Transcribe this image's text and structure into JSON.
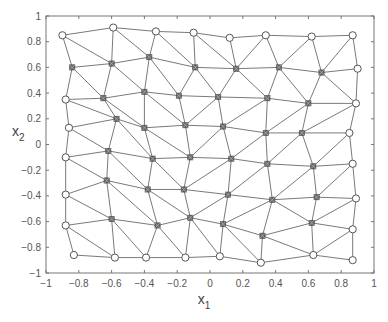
{
  "chart_data": {
    "type": "scatter",
    "subtype": "triangular-mesh",
    "title": "",
    "xlabel": "x",
    "xlabel_sub": "1",
    "ylabel": "x",
    "ylabel_sub": "2",
    "xlim": [
      -1,
      1
    ],
    "ylim": [
      -1,
      1
    ],
    "grid": false,
    "legend": null,
    "xticks": [
      -1,
      -0.8,
      -0.6,
      -0.4,
      -0.2,
      0,
      0.2,
      0.4,
      0.6,
      0.8,
      1
    ],
    "xtick_labels": [
      "−1",
      "−0.8",
      "−0.6",
      "−0.4",
      "−0.2",
      "0",
      "0.2",
      "0.4",
      "0.6",
      "0.8",
      "1"
    ],
    "yticks": [
      -1,
      -0.8,
      -0.6,
      -0.4,
      -0.2,
      0,
      0.2,
      0.4,
      0.6,
      0.8,
      1
    ],
    "ytick_labels": [
      "−1",
      "−0.8",
      "−0.6",
      "−0.4",
      "−0.2",
      "0",
      "0.2",
      "0.4",
      "0.6",
      "0.8",
      "1"
    ],
    "line_color": "#7a7a7a",
    "marker_color": "#555555",
    "nodes": [
      {
        "id": 0,
        "x": -0.9,
        "y": 0.85,
        "boundary": true
      },
      {
        "id": 1,
        "x": -0.59,
        "y": 0.91,
        "boundary": true
      },
      {
        "id": 2,
        "x": -0.33,
        "y": 0.88,
        "boundary": true
      },
      {
        "id": 3,
        "x": -0.1,
        "y": 0.87,
        "boundary": true
      },
      {
        "id": 4,
        "x": 0.12,
        "y": 0.83,
        "boundary": true
      },
      {
        "id": 5,
        "x": 0.34,
        "y": 0.85,
        "boundary": true
      },
      {
        "id": 6,
        "x": 0.62,
        "y": 0.84,
        "boundary": true
      },
      {
        "id": 7,
        "x": 0.87,
        "y": 0.85,
        "boundary": true
      },
      {
        "id": 8,
        "x": -0.84,
        "y": 0.6,
        "boundary": false
      },
      {
        "id": 9,
        "x": -0.6,
        "y": 0.63,
        "boundary": false
      },
      {
        "id": 10,
        "x": -0.37,
        "y": 0.68,
        "boundary": false
      },
      {
        "id": 11,
        "x": -0.09,
        "y": 0.6,
        "boundary": false
      },
      {
        "id": 12,
        "x": 0.16,
        "y": 0.59,
        "boundary": false
      },
      {
        "id": 13,
        "x": 0.42,
        "y": 0.6,
        "boundary": false
      },
      {
        "id": 14,
        "x": 0.68,
        "y": 0.56,
        "boundary": false
      },
      {
        "id": 15,
        "x": 0.9,
        "y": 0.59,
        "boundary": true
      },
      {
        "id": 16,
        "x": -0.88,
        "y": 0.35,
        "boundary": true
      },
      {
        "id": 17,
        "x": -0.65,
        "y": 0.36,
        "boundary": false
      },
      {
        "id": 18,
        "x": -0.4,
        "y": 0.41,
        "boundary": false
      },
      {
        "id": 19,
        "x": -0.19,
        "y": 0.38,
        "boundary": false
      },
      {
        "id": 20,
        "x": 0.05,
        "y": 0.37,
        "boundary": false
      },
      {
        "id": 21,
        "x": 0.35,
        "y": 0.36,
        "boundary": false
      },
      {
        "id": 22,
        "x": 0.6,
        "y": 0.32,
        "boundary": false
      },
      {
        "id": 23,
        "x": 0.89,
        "y": 0.32,
        "boundary": true
      },
      {
        "id": 24,
        "x": -0.86,
        "y": 0.13,
        "boundary": true
      },
      {
        "id": 25,
        "x": -0.57,
        "y": 0.2,
        "boundary": false
      },
      {
        "id": 26,
        "x": -0.4,
        "y": 0.13,
        "boundary": false
      },
      {
        "id": 27,
        "x": -0.15,
        "y": 0.15,
        "boundary": false
      },
      {
        "id": 28,
        "x": 0.08,
        "y": 0.14,
        "boundary": false
      },
      {
        "id": 29,
        "x": 0.34,
        "y": 0.09,
        "boundary": false
      },
      {
        "id": 30,
        "x": 0.56,
        "y": 0.09,
        "boundary": false
      },
      {
        "id": 31,
        "x": 0.85,
        "y": 0.09,
        "boundary": true
      },
      {
        "id": 32,
        "x": -0.88,
        "y": -0.1,
        "boundary": true
      },
      {
        "id": 33,
        "x": -0.62,
        "y": -0.05,
        "boundary": false
      },
      {
        "id": 34,
        "x": -0.35,
        "y": -0.11,
        "boundary": false
      },
      {
        "id": 35,
        "x": -0.12,
        "y": -0.1,
        "boundary": false
      },
      {
        "id": 36,
        "x": 0.13,
        "y": -0.11,
        "boundary": false
      },
      {
        "id": 37,
        "x": 0.35,
        "y": -0.15,
        "boundary": false
      },
      {
        "id": 38,
        "x": 0.63,
        "y": -0.17,
        "boundary": false
      },
      {
        "id": 39,
        "x": 0.87,
        "y": -0.15,
        "boundary": true
      },
      {
        "id": 40,
        "x": -0.88,
        "y": -0.39,
        "boundary": true
      },
      {
        "id": 41,
        "x": -0.63,
        "y": -0.28,
        "boundary": false
      },
      {
        "id": 42,
        "x": -0.38,
        "y": -0.35,
        "boundary": false
      },
      {
        "id": 43,
        "x": -0.16,
        "y": -0.35,
        "boundary": false
      },
      {
        "id": 44,
        "x": 0.11,
        "y": -0.39,
        "boundary": false
      },
      {
        "id": 45,
        "x": 0.38,
        "y": -0.43,
        "boundary": false
      },
      {
        "id": 46,
        "x": 0.65,
        "y": -0.41,
        "boundary": false
      },
      {
        "id": 47,
        "x": 0.89,
        "y": -0.42,
        "boundary": true
      },
      {
        "id": 48,
        "x": -0.88,
        "y": -0.63,
        "boundary": true
      },
      {
        "id": 49,
        "x": -0.6,
        "y": -0.58,
        "boundary": false
      },
      {
        "id": 50,
        "x": -0.32,
        "y": -0.63,
        "boundary": false
      },
      {
        "id": 51,
        "x": -0.12,
        "y": -0.57,
        "boundary": false
      },
      {
        "id": 52,
        "x": 0.08,
        "y": -0.62,
        "boundary": false
      },
      {
        "id": 53,
        "x": 0.32,
        "y": -0.71,
        "boundary": false
      },
      {
        "id": 54,
        "x": 0.62,
        "y": -0.61,
        "boundary": false
      },
      {
        "id": 55,
        "x": 0.87,
        "y": -0.66,
        "boundary": true
      },
      {
        "id": 56,
        "x": -0.83,
        "y": -0.86,
        "boundary": true
      },
      {
        "id": 57,
        "x": -0.58,
        "y": -0.88,
        "boundary": true
      },
      {
        "id": 58,
        "x": -0.39,
        "y": -0.88,
        "boundary": true
      },
      {
        "id": 59,
        "x": -0.15,
        "y": -0.88,
        "boundary": true
      },
      {
        "id": 60,
        "x": 0.06,
        "y": -0.87,
        "boundary": true
      },
      {
        "id": 61,
        "x": 0.31,
        "y": -0.92,
        "boundary": true
      },
      {
        "id": 62,
        "x": 0.63,
        "y": -0.86,
        "boundary": true
      },
      {
        "id": 63,
        "x": 0.87,
        "y": -0.9,
        "boundary": true
      }
    ],
    "edges": [
      [
        0,
        1
      ],
      [
        1,
        2
      ],
      [
        2,
        3
      ],
      [
        3,
        4
      ],
      [
        4,
        5
      ],
      [
        5,
        6
      ],
      [
        6,
        7
      ],
      [
        0,
        8
      ],
      [
        0,
        9
      ],
      [
        1,
        9
      ],
      [
        1,
        10
      ],
      [
        2,
        10
      ],
      [
        2,
        11
      ],
      [
        3,
        11
      ],
      [
        3,
        12
      ],
      [
        4,
        12
      ],
      [
        5,
        12
      ],
      [
        5,
        13
      ],
      [
        6,
        13
      ],
      [
        6,
        14
      ],
      [
        7,
        14
      ],
      [
        7,
        15
      ],
      [
        8,
        9
      ],
      [
        9,
        10
      ],
      [
        10,
        11
      ],
      [
        11,
        12
      ],
      [
        12,
        13
      ],
      [
        13,
        14
      ],
      [
        14,
        15
      ],
      [
        8,
        16
      ],
      [
        8,
        17
      ],
      [
        9,
        17
      ],
      [
        9,
        18
      ],
      [
        10,
        18
      ],
      [
        10,
        19
      ],
      [
        11,
        19
      ],
      [
        11,
        20
      ],
      [
        12,
        20
      ],
      [
        12,
        21
      ],
      [
        13,
        21
      ],
      [
        13,
        22
      ],
      [
        14,
        22
      ],
      [
        14,
        23
      ],
      [
        15,
        23
      ],
      [
        16,
        17
      ],
      [
        17,
        18
      ],
      [
        18,
        19
      ],
      [
        19,
        20
      ],
      [
        20,
        21
      ],
      [
        21,
        22
      ],
      [
        22,
        23
      ],
      [
        16,
        24
      ],
      [
        16,
        25
      ],
      [
        17,
        25
      ],
      [
        17,
        26
      ],
      [
        18,
        26
      ],
      [
        18,
        27
      ],
      [
        19,
        27
      ],
      [
        20,
        27
      ],
      [
        20,
        28
      ],
      [
        21,
        28
      ],
      [
        21,
        29
      ],
      [
        22,
        29
      ],
      [
        22,
        30
      ],
      [
        23,
        30
      ],
      [
        23,
        31
      ],
      [
        24,
        25
      ],
      [
        25,
        26
      ],
      [
        26,
        27
      ],
      [
        27,
        28
      ],
      [
        28,
        29
      ],
      [
        29,
        30
      ],
      [
        30,
        31
      ],
      [
        24,
        32
      ],
      [
        24,
        33
      ],
      [
        25,
        33
      ],
      [
        25,
        34
      ],
      [
        26,
        34
      ],
      [
        26,
        35
      ],
      [
        27,
        35
      ],
      [
        28,
        35
      ],
      [
        28,
        36
      ],
      [
        29,
        36
      ],
      [
        29,
        37
      ],
      [
        30,
        37
      ],
      [
        30,
        38
      ],
      [
        31,
        38
      ],
      [
        31,
        39
      ],
      [
        32,
        33
      ],
      [
        33,
        34
      ],
      [
        34,
        35
      ],
      [
        35,
        36
      ],
      [
        36,
        37
      ],
      [
        37,
        38
      ],
      [
        38,
        39
      ],
      [
        32,
        40
      ],
      [
        32,
        41
      ],
      [
        33,
        41
      ],
      [
        33,
        42
      ],
      [
        34,
        42
      ],
      [
        34,
        43
      ],
      [
        35,
        43
      ],
      [
        36,
        43
      ],
      [
        36,
        44
      ],
      [
        37,
        44
      ],
      [
        37,
        45
      ],
      [
        38,
        45
      ],
      [
        38,
        46
      ],
      [
        39,
        46
      ],
      [
        39,
        47
      ],
      [
        40,
        41
      ],
      [
        41,
        42
      ],
      [
        42,
        43
      ],
      [
        43,
        44
      ],
      [
        44,
        45
      ],
      [
        45,
        46
      ],
      [
        46,
        47
      ],
      [
        40,
        48
      ],
      [
        40,
        49
      ],
      [
        41,
        49
      ],
      [
        41,
        50
      ],
      [
        42,
        50
      ],
      [
        42,
        51
      ],
      [
        43,
        51
      ],
      [
        44,
        51
      ],
      [
        44,
        52
      ],
      [
        45,
        52
      ],
      [
        45,
        53
      ],
      [
        45,
        54
      ],
      [
        46,
        54
      ],
      [
        47,
        54
      ],
      [
        47,
        55
      ],
      [
        48,
        49
      ],
      [
        49,
        50
      ],
      [
        50,
        51
      ],
      [
        51,
        52
      ],
      [
        52,
        53
      ],
      [
        53,
        54
      ],
      [
        54,
        55
      ],
      [
        48,
        56
      ],
      [
        48,
        57
      ],
      [
        49,
        57
      ],
      [
        49,
        58
      ],
      [
        50,
        58
      ],
      [
        50,
        59
      ],
      [
        51,
        59
      ],
      [
        51,
        60
      ],
      [
        52,
        60
      ],
      [
        52,
        61
      ],
      [
        53,
        61
      ],
      [
        53,
        62
      ],
      [
        54,
        62
      ],
      [
        55,
        62
      ],
      [
        55,
        63
      ],
      [
        56,
        57
      ],
      [
        57,
        58
      ],
      [
        58,
        59
      ],
      [
        59,
        60
      ],
      [
        60,
        61
      ],
      [
        61,
        62
      ],
      [
        62,
        63
      ]
    ]
  },
  "plot_box": {
    "left": 46,
    "top": 16,
    "right": 374,
    "bottom": 273
  }
}
